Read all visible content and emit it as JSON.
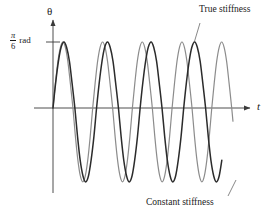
{
  "figure": {
    "background_color": "#ffffff",
    "axis_color": "#3a3a3a",
    "width": 276,
    "height": 218
  },
  "axes": {
    "y_axis_label": "θ",
    "x_axis_label": "t",
    "y_tick_numerator": "π",
    "y_tick_denominator": "6",
    "y_tick_unit": "rad",
    "y_tick_value_text": "π/6 rad",
    "origin_px": [
      53,
      108
    ],
    "x_axis_end_px": [
      250,
      108
    ],
    "y_axis_top_px": [
      53,
      20
    ]
  },
  "annotations": [
    {
      "name": "true-stiffness",
      "text": "True stiffness",
      "leader_from": [
        200,
        23
      ],
      "leader_to": [
        194,
        43
      ]
    },
    {
      "name": "constant-stiffness",
      "text": "Constant stiffness",
      "leader_from": [
        228,
        196
      ],
      "leader_to": [
        236,
        180
      ]
    }
  ],
  "chart_data": {
    "type": "line",
    "title": "",
    "xlabel": "t",
    "ylabel": "θ",
    "grid": false,
    "legend": "annotated-callouts",
    "xlim": [
      0,
      10.6
    ],
    "ylim": [
      -1.12,
      1.0
    ],
    "ytick_values": [
      1.0
    ],
    "ytick_labels": [
      "π/6 rad"
    ],
    "xtick_values": [],
    "xtick_labels": [],
    "series": [
      {
        "name": "True stiffness",
        "color": "#2b2b2b",
        "line_width": 1.5,
        "amplitude": 1.0,
        "period": 2.47,
        "phase": 0.0,
        "trough_amplitude": -1.12,
        "x": [
          0.0,
          0.15,
          0.31,
          0.46,
          0.62,
          0.77,
          0.93,
          1.08,
          1.24,
          1.39,
          1.54,
          1.7,
          1.85,
          2.01,
          2.16,
          2.32,
          2.47,
          2.62,
          2.78,
          2.93,
          3.09,
          3.24,
          3.4,
          3.55,
          3.71,
          3.86,
          4.01,
          4.17,
          4.32,
          4.48,
          4.63,
          4.79,
          4.94,
          5.09,
          5.25,
          5.4,
          5.56,
          5.71,
          5.87,
          6.02,
          6.18,
          6.33,
          6.48,
          6.64,
          6.79,
          6.95,
          7.1,
          7.26,
          7.41,
          7.56,
          7.72,
          7.87,
          8.03,
          8.18,
          8.34,
          8.49,
          8.65,
          8.8,
          8.95,
          9.11,
          9.26,
          9.42,
          9.57
        ],
        "y": [
          0.0,
          0.38,
          0.71,
          0.92,
          1.0,
          0.92,
          0.71,
          0.38,
          0.0,
          -0.43,
          -0.79,
          -1.03,
          -1.12,
          -1.03,
          -0.79,
          -0.43,
          0.0,
          0.38,
          0.71,
          0.92,
          1.0,
          0.92,
          0.71,
          0.38,
          0.0,
          -0.43,
          -0.79,
          -1.03,
          -1.12,
          -1.03,
          -0.79,
          -0.43,
          0.0,
          0.38,
          0.71,
          0.92,
          1.0,
          0.92,
          0.71,
          0.38,
          0.0,
          -0.43,
          -0.79,
          -1.03,
          -1.12,
          -1.03,
          -0.79,
          -0.43,
          0.0,
          0.38,
          0.71,
          0.92,
          1.0,
          0.92,
          0.71,
          0.38,
          0.0,
          -0.43,
          -0.79,
          -1.03,
          -1.12,
          -1.03,
          -0.79
        ]
      },
      {
        "name": "Constant stiffness",
        "color": "#8c8c8c",
        "line_width": 1.2,
        "amplitude": 1.0,
        "period": 2.25,
        "phase": 0.0,
        "trough_amplitude": -1.12,
        "x": [
          0.0,
          0.14,
          0.28,
          0.42,
          0.56,
          0.7,
          0.84,
          0.98,
          1.13,
          1.27,
          1.41,
          1.55,
          1.69,
          1.83,
          1.97,
          2.11,
          2.25,
          2.39,
          2.53,
          2.67,
          2.81,
          2.95,
          3.09,
          3.23,
          3.38,
          3.52,
          3.66,
          3.8,
          3.94,
          4.08,
          4.22,
          4.36,
          4.5,
          4.64,
          4.78,
          4.92,
          5.06,
          5.2,
          5.34,
          5.48,
          5.63,
          5.77,
          5.91,
          6.05,
          6.19,
          6.33,
          6.47,
          6.61,
          6.75,
          6.89,
          7.03,
          7.17,
          7.31,
          7.45,
          7.59,
          7.73,
          7.88,
          8.02,
          8.16,
          8.3,
          8.44,
          8.58,
          8.72,
          8.86,
          9.0,
          9.14,
          9.28,
          9.42,
          9.56,
          9.7,
          9.84,
          9.98,
          10.13,
          10.2
        ],
        "y": [
          0.0,
          0.38,
          0.71,
          0.92,
          1.0,
          0.92,
          0.71,
          0.38,
          0.0,
          -0.43,
          -0.79,
          -1.03,
          -1.12,
          -1.03,
          -0.79,
          -0.43,
          0.0,
          0.38,
          0.71,
          0.92,
          1.0,
          0.92,
          0.71,
          0.38,
          0.0,
          -0.43,
          -0.79,
          -1.03,
          -1.12,
          -1.03,
          -0.79,
          -0.43,
          0.0,
          0.38,
          0.71,
          0.92,
          1.0,
          0.92,
          0.71,
          0.38,
          0.0,
          -0.43,
          -0.79,
          -1.03,
          -1.12,
          -1.03,
          -0.79,
          -0.43,
          0.0,
          0.38,
          0.71,
          0.92,
          1.0,
          0.92,
          0.71,
          0.38,
          0.0,
          -0.43,
          -0.79,
          -1.03,
          -1.12,
          -1.03,
          -0.79,
          -0.43,
          0.0,
          0.38,
          0.71,
          0.92,
          1.0,
          0.92,
          0.71,
          0.38,
          0.0,
          -0.2
        ]
      }
    ]
  }
}
